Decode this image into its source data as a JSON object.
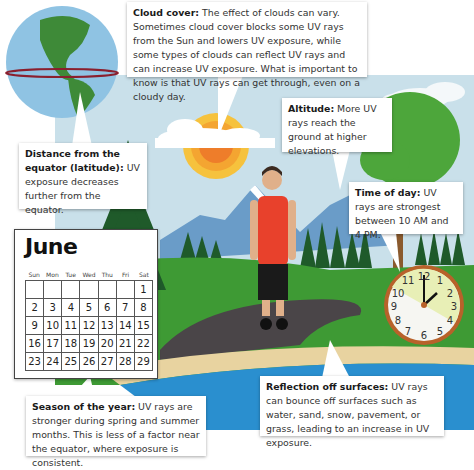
{
  "callouts": {
    "cloud_cover": {
      "title": "Cloud cover:",
      "text": " The effect of clouds can vary. Sometimes cloud cover blocks some UV rays from the Sun and lowers UV exposure, while some types of clouds can reflect UV rays and can increase UV exposure. What is important to know is that UV rays can get through, even on a cloudy day."
    },
    "latitude": {
      "title": "Distance from the equator (latitude):",
      "text": " UV exposure decreases further from the equator."
    },
    "altitude": {
      "title": "Altitude:",
      "text": " More UV rays reach the ground at higher elevations."
    },
    "time_of_day": {
      "title": "Time of day:",
      "text": " UV rays are strongest between 10 AM and 4 PM."
    },
    "season": {
      "title": "Season of the year:",
      "text": " UV rays are stronger during spring and summer months. This is less of a factor near the equator, where exposure is consistent."
    },
    "reflection": {
      "title": "Reflection off surfaces:",
      "text": " UV rays can bounce off surfaces such as water, sand, snow, pavement, or grass, leading to an increase in UV exposure."
    }
  },
  "calendar": {
    "month": "June",
    "weekdays": [
      "Sun",
      "Mon",
      "Tue",
      "Wed",
      "Thu",
      "Fri",
      "Sat"
    ],
    "weeks": [
      [
        "",
        "",
        "",
        "",
        "",
        "",
        "1"
      ],
      [
        "2",
        "3",
        "4",
        "5",
        "6",
        "7",
        "8"
      ],
      [
        "9",
        "10",
        "11",
        "12",
        "13",
        "14",
        "15"
      ],
      [
        "16",
        "17",
        "18",
        "19",
        "20",
        "21",
        "22"
      ],
      [
        "23",
        "24",
        "25",
        "26",
        "27",
        "28",
        "29"
      ]
    ]
  },
  "clock": {
    "numbers": [
      "12",
      "1",
      "2",
      "3",
      "4",
      "5",
      "6",
      "7",
      "8",
      "9",
      "10",
      "11"
    ],
    "highlight_from": "10",
    "highlight_to": "4",
    "hour_hand": "2",
    "minute_hand": "12"
  },
  "colors": {
    "sky": "#c9e0ea",
    "grass": "#3e9a34",
    "tree_dark": "#1f5a2a",
    "water": "#2a8fcf",
    "sand": "#e8d3a0",
    "path": "#4a4548",
    "sun_outer": "#f6c23d",
    "sun_inner": "#ee7d2a",
    "shirt": "#e8412c",
    "clock_rim": "#b8622a",
    "clock_highlight": "#e8efb6"
  }
}
